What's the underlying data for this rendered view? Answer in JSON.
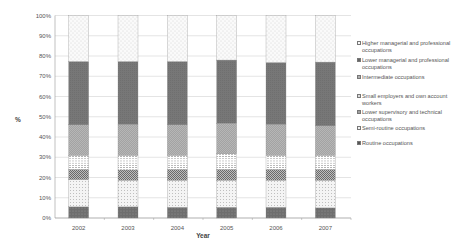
{
  "chart_data": {
    "type": "bar",
    "stacked": true,
    "percent_stacked": true,
    "title": "",
    "xlabel": "Year",
    "ylabel": "%",
    "ylim": [
      0,
      100
    ],
    "yticks": [
      "0%",
      "10%",
      "20%",
      "30%",
      "40%",
      "50%",
      "60%",
      "70%",
      "80%",
      "90%",
      "100%"
    ],
    "grid": true,
    "legend_position": "right",
    "categories": [
      "2002",
      "2003",
      "2004",
      "2005",
      "2006",
      "2007"
    ],
    "series": [
      {
        "name": "Routine occupations",
        "color": "#6e6e6e",
        "pattern": "dark-dots",
        "values": [
          5.5,
          5.5,
          5.3,
          5.3,
          5.3,
          5.0
        ]
      },
      {
        "name": "Semi-routine occupations",
        "color": "#f2f2f2",
        "pattern": "light-dots",
        "values": [
          13.5,
          13.2,
          13.4,
          13.4,
          13.4,
          13.7
        ]
      },
      {
        "name": "Lower supervisory and technical occupations",
        "color": "#9a9a9a",
        "pattern": "checker",
        "values": [
          5.0,
          5.0,
          5.3,
          5.3,
          5.3,
          5.3
        ]
      },
      {
        "name": "Small employers and own account workers",
        "color": "#ffffff",
        "pattern": "horizontal-dashes",
        "values": [
          7.0,
          7.3,
          7.0,
          7.7,
          7.0,
          7.0
        ]
      },
      {
        "name": "Intermediate occupations",
        "color": "#b4b4b4",
        "pattern": "crosshatch",
        "values": [
          15.0,
          15.3,
          15.0,
          15.1,
          15.3,
          14.5
        ]
      },
      {
        "name": "Lower managerial and professional occupations",
        "color": "#777777",
        "pattern": "solid",
        "values": [
          31.3,
          31.0,
          31.3,
          31.2,
          30.5,
          31.5
        ]
      },
      {
        "name": "Higher managerial and professional occupations",
        "color": "#f7f7f7",
        "pattern": "sparse-dots",
        "values": [
          22.7,
          22.7,
          22.7,
          22.0,
          23.2,
          23.0
        ]
      }
    ]
  },
  "legend": {
    "items": [
      {
        "label": "Higher managerial and professional occupations",
        "color": "#f7f7f7"
      },
      {
        "label": "Lower managerial and professional occupations",
        "color": "#777777"
      },
      {
        "label": "Intermediate occupations",
        "color": "#b4b4b4"
      },
      {
        "label": "Small employers and own account workers",
        "color": "#ffffff"
      },
      {
        "label": "Lower supervisory and technical occupations",
        "color": "#9a9a9a"
      },
      {
        "label": "Semi-routine occupations",
        "color": "#f2f2f2"
      },
      {
        "label": "Routine occupations",
        "color": "#6e6e6e"
      }
    ]
  }
}
